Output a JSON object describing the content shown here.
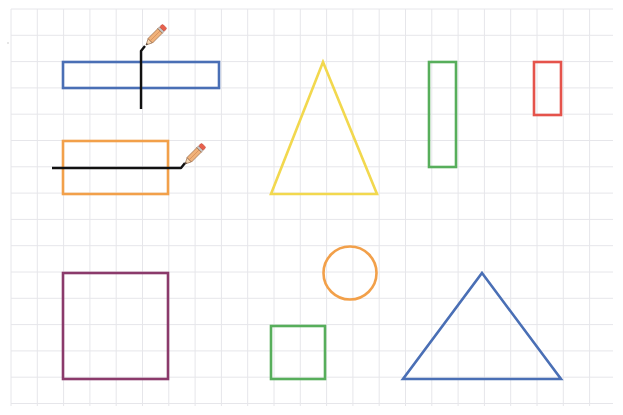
{
  "canvas": {
    "width": 623,
    "height": 415,
    "background": "#ffffff",
    "grid": {
      "color": "#e6e6ea",
      "x_start": 11,
      "y_start": 9,
      "x_end": 613,
      "y_end": 406,
      "spacing": 26.3
    }
  },
  "shapes": [
    {
      "id": "blue-rectangle",
      "type": "rect",
      "x": 63,
      "y": 62,
      "w": 156,
      "h": 26,
      "stroke": "#4a6fb5"
    },
    {
      "id": "orange-rectangle",
      "type": "rect",
      "x": 63,
      "y": 141,
      "w": 105,
      "h": 53,
      "stroke": "#f2a04a"
    },
    {
      "id": "yellow-triangle",
      "type": "polygon",
      "points": "323,62 377,194 271,194",
      "stroke": "#f2d84e"
    },
    {
      "id": "tall-green-rectangle",
      "type": "rect",
      "x": 429,
      "y": 62,
      "w": 27,
      "h": 105,
      "stroke": "#57ae5b"
    },
    {
      "id": "red-rectangle",
      "type": "rect",
      "x": 534,
      "y": 62,
      "w": 27,
      "h": 53,
      "stroke": "#e5534b"
    },
    {
      "id": "purple-square",
      "type": "rect",
      "x": 63,
      "y": 273,
      "w": 105,
      "h": 106,
      "stroke": "#8b3a6b"
    },
    {
      "id": "orange-circle",
      "type": "circle",
      "cx": 350,
      "cy": 273,
      "r": 26.5,
      "stroke": "#f2a04a"
    },
    {
      "id": "green-square",
      "type": "rect",
      "x": 271,
      "y": 326,
      "w": 54,
      "h": 53,
      "stroke": "#57ae5b"
    },
    {
      "id": "blue-triangle",
      "type": "polygon",
      "points": "482,273 561,379 403,379",
      "stroke": "#4a6fb5"
    }
  ],
  "cut_lines": [
    {
      "id": "vertical-cut-line",
      "points": "141,109 141,51 145,46",
      "stroke": "#111111"
    },
    {
      "id": "horizontal-cut-line",
      "points": "52,168 181,168 185,163",
      "stroke": "#111111"
    }
  ],
  "pencils": [
    {
      "id": "pencil-vertical",
      "x": 146,
      "y": 45,
      "angle": -45
    },
    {
      "id": "pencil-horizontal",
      "x": 185,
      "y": 164,
      "angle": -45
    }
  ],
  "pencil_colors": {
    "body": "#f0b27a",
    "body_stroke": "#8a5a3a",
    "eraser": "#e8604c",
    "ferrule": "#c9c9c9",
    "wood": "#f5d6b0",
    "lead": "#333333"
  }
}
